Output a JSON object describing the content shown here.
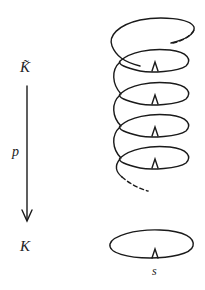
{
  "diagram": {
    "type": "covering-space",
    "labels": {
      "cover_space": "K̃",
      "projection": "p",
      "base_space": "K",
      "base_point": "s"
    },
    "helix": {
      "loops_shown": 5,
      "basepoint_markers": 4,
      "continues_above": true,
      "continues_below": true
    },
    "base_circle": {
      "basepoint_markers": 1
    },
    "colors": {
      "ink": "#1a1a1a",
      "background": "#ffffff"
    }
  }
}
